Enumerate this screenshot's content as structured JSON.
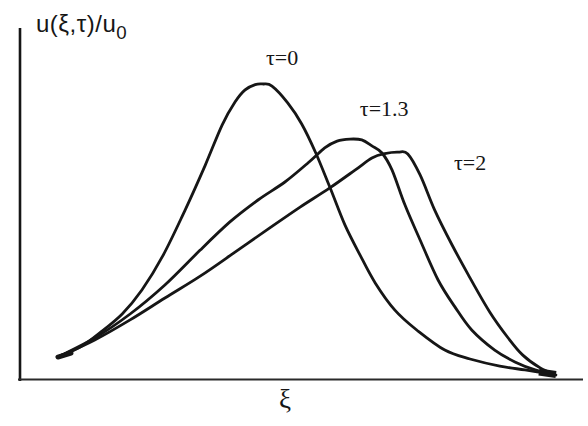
{
  "figure": {
    "background": "#ffffff",
    "ink": "#161616",
    "axis_ink": "#2a2a2a",
    "ylabel_main": "u(ξ,τ)/u",
    "ylabel_sub": "0",
    "xlabel": "ξ"
  },
  "chart_data": {
    "type": "line",
    "title": "",
    "xlabel": "ξ",
    "ylabel": "u(ξ,τ)/u₀",
    "xlim": [
      0,
      10
    ],
    "ylim": [
      0,
      1.19
    ],
    "grid": false,
    "ticks": "none",
    "legend_position": "inline-annotations",
    "series": [
      {
        "name": "τ=0",
        "peak": {
          "x": 4.35,
          "y": 1.0
        },
        "points": [
          [
            0.73,
            0.081
          ],
          [
            1.09,
            0.111
          ],
          [
            1.44,
            0.159
          ],
          [
            1.84,
            0.223
          ],
          [
            2.19,
            0.304
          ],
          [
            2.57,
            0.422
          ],
          [
            2.96,
            0.574
          ],
          [
            3.32,
            0.726
          ],
          [
            3.62,
            0.861
          ],
          [
            3.85,
            0.939
          ],
          [
            4.03,
            0.98
          ],
          [
            4.21,
            0.998
          ],
          [
            4.35,
            1.0
          ],
          [
            4.51,
            0.993
          ],
          [
            4.79,
            0.936
          ],
          [
            5.04,
            0.865
          ],
          [
            5.29,
            0.767
          ],
          [
            5.54,
            0.652
          ],
          [
            5.81,
            0.524
          ],
          [
            6.08,
            0.422
          ],
          [
            6.35,
            0.328
          ],
          [
            6.7,
            0.236
          ],
          [
            7.09,
            0.169
          ],
          [
            7.59,
            0.101
          ],
          [
            8.04,
            0.071
          ],
          [
            8.57,
            0.047
          ],
          [
            9.02,
            0.034
          ],
          [
            9.5,
            0.02
          ]
        ]
      },
      {
        "name": "τ=1.3",
        "peak": {
          "x": 5.9,
          "y": 0.814
        },
        "points": [
          [
            0.73,
            0.081
          ],
          [
            1.35,
            0.142
          ],
          [
            1.98,
            0.223
          ],
          [
            2.6,
            0.321
          ],
          [
            3.23,
            0.439
          ],
          [
            3.76,
            0.534
          ],
          [
            4.26,
            0.608
          ],
          [
            4.74,
            0.669
          ],
          [
            5.15,
            0.733
          ],
          [
            5.45,
            0.784
          ],
          [
            5.67,
            0.807
          ],
          [
            5.9,
            0.814
          ],
          [
            6.11,
            0.811
          ],
          [
            6.29,
            0.791
          ],
          [
            6.47,
            0.767
          ],
          [
            6.65,
            0.709
          ],
          [
            6.88,
            0.591
          ],
          [
            7.15,
            0.473
          ],
          [
            7.47,
            0.338
          ],
          [
            7.77,
            0.247
          ],
          [
            8.07,
            0.169
          ],
          [
            8.48,
            0.101
          ],
          [
            8.84,
            0.061
          ],
          [
            9.2,
            0.034
          ],
          [
            9.5,
            0.02
          ]
        ]
      },
      {
        "name": "τ=2",
        "peak": {
          "x": 6.76,
          "y": 0.77
        },
        "points": [
          [
            0.73,
            0.081
          ],
          [
            1.35,
            0.135
          ],
          [
            1.98,
            0.203
          ],
          [
            2.6,
            0.277
          ],
          [
            3.23,
            0.351
          ],
          [
            3.85,
            0.432
          ],
          [
            4.47,
            0.514
          ],
          [
            5.01,
            0.584
          ],
          [
            5.54,
            0.649
          ],
          [
            5.99,
            0.709
          ],
          [
            6.29,
            0.75
          ],
          [
            6.52,
            0.765
          ],
          [
            6.76,
            0.77
          ],
          [
            6.93,
            0.764
          ],
          [
            7.15,
            0.693
          ],
          [
            7.41,
            0.574
          ],
          [
            7.72,
            0.456
          ],
          [
            8.04,
            0.345
          ],
          [
            8.39,
            0.23
          ],
          [
            8.72,
            0.142
          ],
          [
            8.98,
            0.084
          ],
          [
            9.29,
            0.041
          ],
          [
            9.57,
            0.017
          ]
        ]
      }
    ],
    "annotations": [
      {
        "text": "τ=0",
        "x": 4.69,
        "y": 1.088
      },
      {
        "text": "τ=1.3",
        "x": 6.51,
        "y": 0.916
      },
      {
        "text": "τ=2",
        "x": 8.04,
        "y": 0.733
      }
    ]
  }
}
